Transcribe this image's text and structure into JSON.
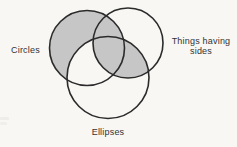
{
  "diagram": {
    "type": "venn",
    "sets": [
      {
        "label": "Circles"
      },
      {
        "label": "Things having sides",
        "label_lines": [
          "Things having",
          "sides"
        ]
      },
      {
        "label": "Ellipses"
      }
    ],
    "shaded_regions": [
      "Circles excluding Ellipses",
      "Things having sides intersected with Ellipses"
    ],
    "colors": {
      "shade": "#c6c6c6",
      "stroke": "#2b2b2b",
      "paper": "#f8f7f4",
      "text": "#333333"
    }
  }
}
